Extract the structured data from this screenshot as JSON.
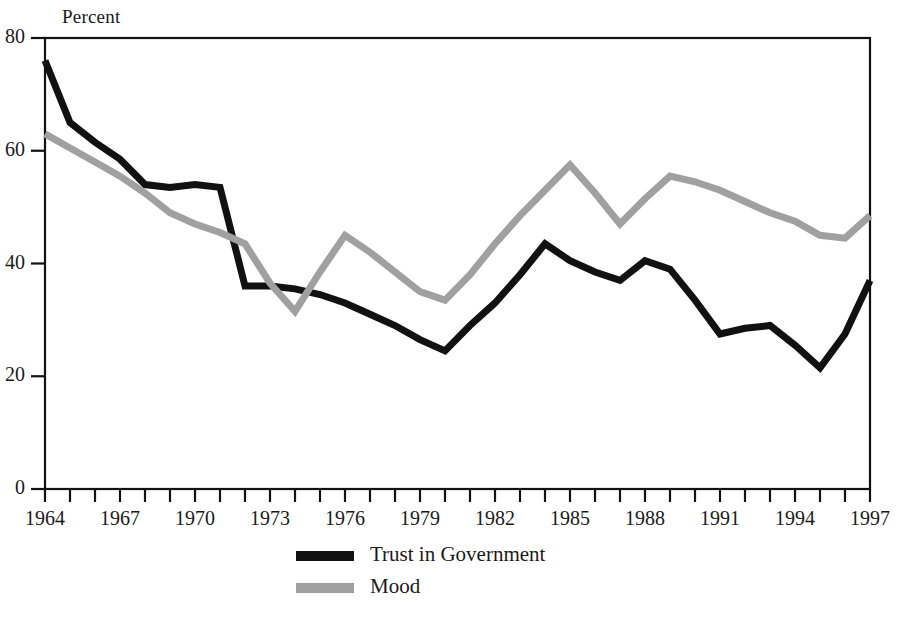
{
  "chart_data": {
    "type": "line",
    "title": "",
    "subtitle": "",
    "xlabel": "",
    "ylabel": "Percent",
    "ylim": [
      0,
      80
    ],
    "xlim": [
      1964,
      1997
    ],
    "yticks": [
      0,
      20,
      40,
      60,
      80
    ],
    "ytick_labels": [
      "0",
      "20",
      "40",
      "60",
      "80"
    ],
    "xticks": [
      1964,
      1967,
      1970,
      1973,
      1976,
      1979,
      1982,
      1985,
      1988,
      1991,
      1994,
      1997
    ],
    "xtick_labels": [
      "1964",
      "1967",
      "1970",
      "1973",
      "1976",
      "1979",
      "1982",
      "1985",
      "1988",
      "1991",
      "1994",
      "1997"
    ],
    "xtick_minor_step": 1,
    "grid": false,
    "legend_position": "bottom-center",
    "x": [
      1964,
      1965,
      1966,
      1967,
      1968,
      1969,
      1970,
      1971,
      1972,
      1973,
      1974,
      1975,
      1976,
      1977,
      1978,
      1979,
      1980,
      1981,
      1982,
      1983,
      1984,
      1985,
      1986,
      1987,
      1988,
      1989,
      1990,
      1991,
      1992,
      1993,
      1994,
      1995,
      1996,
      1997
    ],
    "series": [
      {
        "name": "Trust in Government",
        "color": "#111111",
        "values": [
          76.0,
          65.0,
          61.5,
          58.5,
          54.0,
          53.5,
          54.0,
          53.5,
          36.0,
          36.0,
          35.5,
          34.5,
          33.0,
          31.0,
          29.0,
          26.5,
          24.5,
          29.0,
          33.0,
          38.0,
          43.5,
          40.5,
          38.5,
          37.0,
          40.5,
          39.0,
          33.5,
          27.5,
          28.5,
          29.0,
          25.5,
          21.5,
          27.5,
          37.0
        ]
      },
      {
        "name": "Mood",
        "color": "#a0a0a0",
        "values": [
          63.0,
          60.5,
          58.0,
          55.5,
          52.5,
          49.0,
          47.0,
          45.5,
          43.5,
          36.5,
          31.5,
          38.5,
          45.0,
          42.0,
          38.5,
          35.0,
          33.5,
          38.0,
          43.5,
          48.5,
          53.0,
          57.5,
          52.5,
          47.0,
          51.5,
          55.5,
          54.5,
          53.0,
          51.0,
          49.0,
          47.5,
          45.0,
          44.5,
          48.5
        ]
      }
    ]
  },
  "legend": {
    "items": [
      {
        "label": "Trust in Government",
        "color": "#111111"
      },
      {
        "label": "Mood",
        "color": "#a0a0a0"
      }
    ]
  },
  "axis": {
    "y_title": "Percent"
  }
}
